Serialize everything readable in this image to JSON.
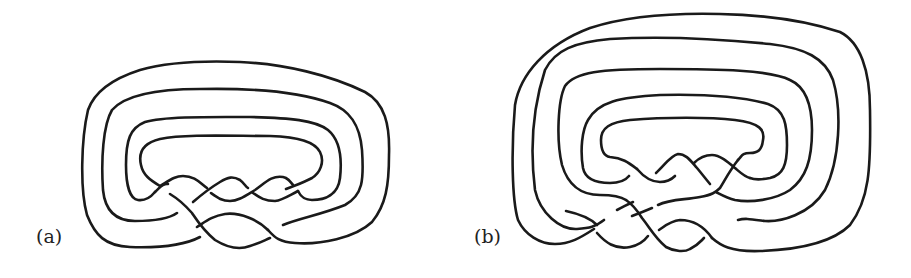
{
  "figure": {
    "panels": [
      {
        "id": "a",
        "label": "(a)",
        "description": "Knot diagram with four nested loops and a braided crossing region"
      },
      {
        "id": "b",
        "label": "(b)",
        "description": "Knot diagram with five nested loops and a braided crossing region"
      }
    ],
    "stroke_color": "#1a1a1a",
    "background": "#ffffff"
  }
}
